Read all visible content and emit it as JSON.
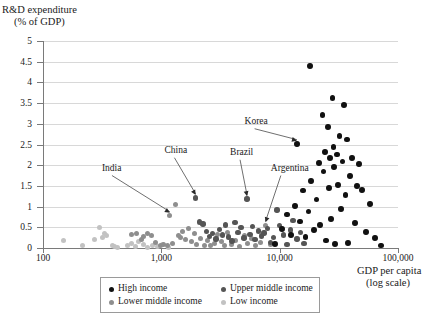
{
  "chart_data": {
    "type": "scatter",
    "title": "",
    "ylabel_line1": "R&D expenditure",
    "ylabel_line2": "(% of GDP)",
    "xlabel_line1": "GDP per capita",
    "xlabel_line2": "(log scale)",
    "xscale": "log",
    "xlim": [
      100,
      100000
    ],
    "ylim": [
      0,
      5
    ],
    "xticks": [
      100,
      1000,
      10000,
      100000
    ],
    "xtick_labels": [
      "100",
      "1,000",
      "10,000",
      "100,000"
    ],
    "yticks": [
      0,
      0.5,
      1,
      1.5,
      2,
      2.5,
      3,
      3.5,
      4,
      4.5,
      5
    ],
    "ytick_labels": [
      "0",
      "0.5",
      "1",
      "1.5",
      "2",
      "2.5",
      "3",
      "3.5",
      "4",
      "4.5",
      "5"
    ],
    "grid": "horizontal",
    "legend_position": "bottom-center",
    "colors": {
      "high_income": "#111111",
      "upper_middle_income": "#555555",
      "lower_middle_income": "#8e8e8e",
      "low_income": "#c2c2c2",
      "gridline": "#d8d8d8",
      "axis": "#7a7a7a"
    },
    "legend": [
      {
        "key": "high_income",
        "label": "High income",
        "color": "#111111"
      },
      {
        "key": "upper_middle_income",
        "label": "Upper middle income",
        "color": "#555555"
      },
      {
        "key": "lower_middle_income",
        "label": "Lower middle income",
        "color": "#8e8e8e"
      },
      {
        "key": "low_income",
        "label": "Low income",
        "color": "#c2c2c2"
      }
    ],
    "annotations": [
      {
        "label": "India",
        "label_x": 430,
        "label_y": 1.92,
        "point_x": 1180,
        "point_y": 0.78
      },
      {
        "label": "China",
        "label_x": 1450,
        "label_y": 2.35,
        "point_x": 1950,
        "point_y": 1.21
      },
      {
        "label": "Brazil",
        "label_x": 5200,
        "label_y": 2.3,
        "point_x": 5300,
        "point_y": 1.18
      },
      {
        "label": "Argentina",
        "label_x": 11500,
        "label_y": 1.92,
        "point_x": 7600,
        "point_y": 0.55
      },
      {
        "label": "Korea",
        "label_x": 6900,
        "label_y": 3.05,
        "point_x": 14000,
        "point_y": 2.52
      }
    ],
    "series": [
      {
        "name": "Low income",
        "key": "low_income",
        "points": [
          [
            148,
            0.19
          ],
          [
            215,
            0.06
          ],
          [
            270,
            0.21
          ],
          [
            300,
            0.5
          ],
          [
            320,
            0.26
          ],
          [
            330,
            0.34
          ],
          [
            345,
            0.3
          ],
          [
            385,
            0.05
          ],
          [
            400,
            0.04
          ],
          [
            430,
            0.02
          ],
          [
            520,
            0.06
          ],
          [
            560,
            0.11
          ],
          [
            600,
            0.03
          ],
          [
            640,
            0.16
          ],
          [
            700,
            0.09
          ],
          [
            760,
            0.02
          ],
          [
            840,
            0.05
          ],
          [
            930,
            0.04
          ],
          [
            1020,
            0.08
          ],
          [
            1150,
            0.02
          ]
        ]
      },
      {
        "name": "Lower middle income",
        "key": "lower_middle_income",
        "points": [
          [
            560,
            0.33
          ],
          [
            620,
            0.36
          ],
          [
            680,
            0.21
          ],
          [
            700,
            0.28
          ],
          [
            760,
            0.34
          ],
          [
            820,
            0.31
          ],
          [
            900,
            0.14
          ],
          [
            980,
            0.05
          ],
          [
            1050,
            0.08
          ],
          [
            1120,
            0.06
          ],
          [
            1180,
            0.78
          ],
          [
            1250,
            0.11
          ],
          [
            1320,
            1.06
          ],
          [
            1400,
            0.3
          ],
          [
            1450,
            0.25
          ],
          [
            1520,
            0.41
          ],
          [
            1600,
            0.2
          ],
          [
            1700,
            0.48
          ],
          [
            1800,
            0.15
          ],
          [
            1900,
            0.34
          ],
          [
            2000,
            0.09
          ],
          [
            2150,
            0.24
          ],
          [
            2300,
            0.07
          ],
          [
            2450,
            0.18
          ],
          [
            2600,
            0.06
          ],
          [
            2800,
            0.11
          ],
          [
            3000,
            0.33
          ],
          [
            3200,
            0.16
          ],
          [
            3400,
            0.05
          ],
          [
            3600,
            0.38
          ],
          [
            3900,
            0.08
          ],
          [
            4200,
            0.19
          ],
          [
            4600,
            0.04
          ],
          [
            5000,
            0.31
          ],
          [
            5400,
            0.12
          ],
          [
            5800,
            0.22
          ],
          [
            6300,
            0.06
          ],
          [
            6900,
            0.13
          ],
          [
            7600,
            0.55
          ],
          [
            8300,
            0.09
          ]
        ]
      },
      {
        "name": "Upper middle income",
        "key": "upper_middle_income",
        "points": [
          [
            1950,
            1.21
          ],
          [
            2100,
            0.63
          ],
          [
            2250,
            0.58
          ],
          [
            2400,
            0.4
          ],
          [
            2550,
            0.28
          ],
          [
            2700,
            0.35
          ],
          [
            2900,
            0.22
          ],
          [
            3100,
            0.44
          ],
          [
            3300,
            0.31
          ],
          [
            3500,
            0.56
          ],
          [
            3700,
            0.27
          ],
          [
            3950,
            0.17
          ],
          [
            4200,
            0.62
          ],
          [
            4450,
            0.38
          ],
          [
            4700,
            0.49
          ],
          [
            5000,
            0.24
          ],
          [
            5300,
            1.18
          ],
          [
            5600,
            0.33
          ],
          [
            5900,
            0.52
          ],
          [
            6200,
            0.2
          ],
          [
            6600,
            0.41
          ],
          [
            7000,
            0.29
          ],
          [
            7400,
            0.36
          ],
          [
            7900,
            0.47
          ],
          [
            8400,
            0.14
          ],
          [
            8900,
            0.25
          ],
          [
            9500,
            0.92
          ],
          [
            10000,
            0.54
          ],
          [
            10800,
            0.31
          ],
          [
            11500,
            0.08
          ],
          [
            12300,
            0.43
          ],
          [
            13000,
            0.66
          ],
          [
            14000,
            0.22
          ],
          [
            15000,
            0.37
          ],
          [
            16000,
            0.11
          ]
        ]
      },
      {
        "name": "High income",
        "key": "high_income",
        "points": [
          [
            9200,
            0.1
          ],
          [
            10500,
            0.46
          ],
          [
            11500,
            0.81
          ],
          [
            12500,
            0.32
          ],
          [
            13500,
            1.01
          ],
          [
            14000,
            2.52
          ],
          [
            14800,
            0.64
          ],
          [
            15800,
            1.39
          ],
          [
            16500,
            0.27
          ],
          [
            17500,
            0.88
          ],
          [
            18000,
            4.4
          ],
          [
            18500,
            1.62
          ],
          [
            19500,
            0.43
          ],
          [
            20500,
            1.17
          ],
          [
            21500,
            2.05
          ],
          [
            22000,
            0.55
          ],
          [
            23000,
            3.22
          ],
          [
            23500,
            1.85
          ],
          [
            24000,
            2.31
          ],
          [
            24500,
            0.18
          ],
          [
            25500,
            2.93
          ],
          [
            26000,
            1.44
          ],
          [
            26500,
            2.17
          ],
          [
            27000,
            0.71
          ],
          [
            28000,
            3.62
          ],
          [
            28500,
            2.44
          ],
          [
            29000,
            1.95
          ],
          [
            29500,
            0.09
          ],
          [
            30500,
            2.26
          ],
          [
            31000,
            1.53
          ],
          [
            32000,
            2.71
          ],
          [
            33000,
            0.95
          ],
          [
            34000,
            2.09
          ],
          [
            35000,
            3.45
          ],
          [
            36000,
            1.28
          ],
          [
            37000,
            2.62
          ],
          [
            38000,
            0.12
          ],
          [
            39500,
            1.74
          ],
          [
            41000,
            2.18
          ],
          [
            43000,
            0.61
          ],
          [
            45000,
            1.49
          ],
          [
            47000,
            2.02
          ],
          [
            50000,
            1.41
          ],
          [
            54000,
            0.38
          ],
          [
            58000,
            1.07
          ],
          [
            64000,
            0.25
          ],
          [
            72000,
            0.06
          ]
        ]
      }
    ]
  }
}
